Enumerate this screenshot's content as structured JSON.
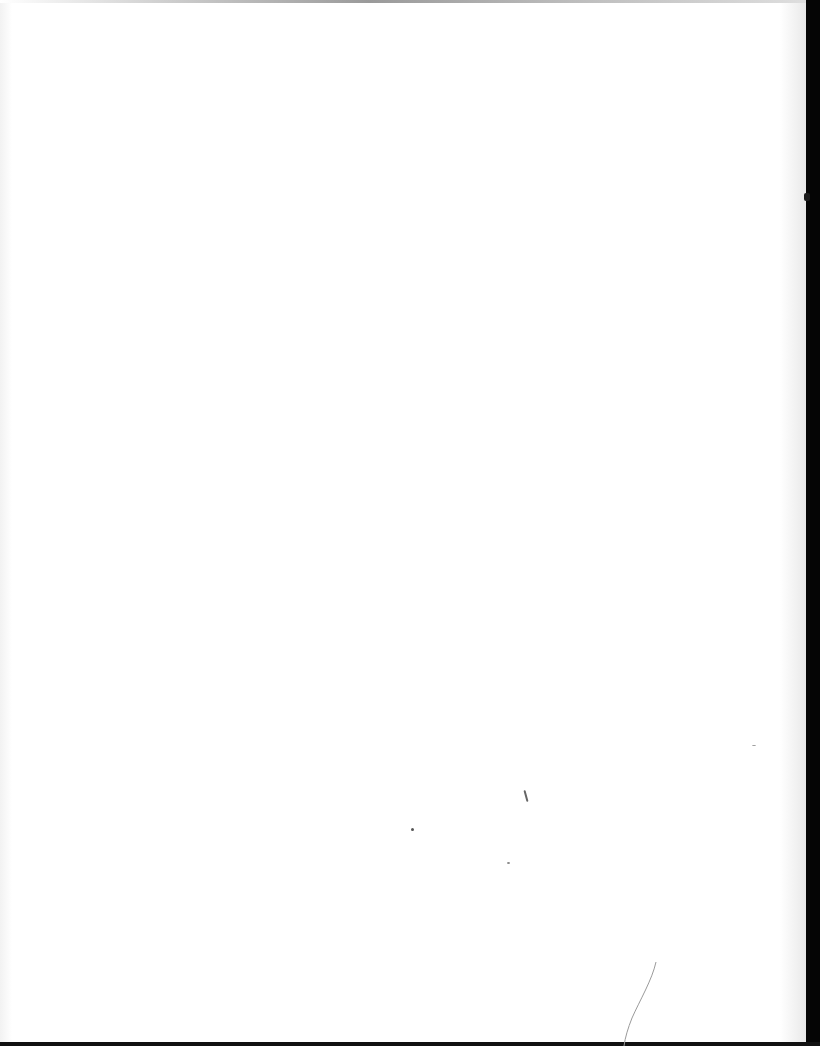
{
  "document": {
    "type": "scanned-page",
    "content": "",
    "colors": {
      "paper": "#ffffff",
      "edge": "#050505"
    }
  }
}
